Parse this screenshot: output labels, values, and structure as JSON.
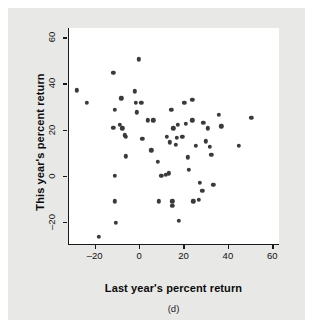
{
  "figure": {
    "caption": "(d)",
    "background_color": "#e8e8e6",
    "plot_background_color": "#ffffff",
    "point_color": "#3a3a3a",
    "axis_color": "#1a1a1a"
  },
  "chart_data": {
    "type": "scatter",
    "title": "",
    "xlabel": "Last year's percent return",
    "ylabel": "This year's percent return",
    "xlim": [
      -32,
      63
    ],
    "ylim": [
      -30,
      64
    ],
    "xticks": [
      -20,
      0,
      20,
      40,
      60
    ],
    "xtick_labels": [
      "–20",
      "0",
      "20",
      "40",
      "60"
    ],
    "yticks": [
      -20,
      0,
      20,
      40,
      60
    ],
    "ytick_labels": [
      "–20",
      "0",
      "20",
      "40",
      "60"
    ],
    "grid": false,
    "legend": null,
    "n_points": 61,
    "points": [
      [
        -28.5,
        37.0
      ],
      [
        -24.0,
        31.5
      ],
      [
        -18.5,
        -26.5
      ],
      [
        -12.0,
        44.5
      ],
      [
        -11.5,
        28.5
      ],
      [
        -12.0,
        20.8
      ],
      [
        -11.5,
        0.0
      ],
      [
        -11.5,
        -11.0
      ],
      [
        -11.0,
        -20.5
      ],
      [
        -8.5,
        33.5
      ],
      [
        -8.0,
        20.5
      ],
      [
        -7.0,
        17.5
      ],
      [
        -6.5,
        17.0
      ],
      [
        -6.5,
        8.5
      ],
      [
        -2.5,
        36.5
      ],
      [
        -2.0,
        31.5
      ],
      [
        -1.5,
        27.5
      ],
      [
        -0.5,
        50.5
      ],
      [
        1.0,
        16.0
      ],
      [
        3.5,
        24.0
      ],
      [
        5.0,
        11.0
      ],
      [
        8.0,
        6.0
      ],
      [
        8.5,
        -11.0
      ],
      [
        9.5,
        0.0
      ],
      [
        11.5,
        0.3
      ],
      [
        13.0,
        1.0
      ],
      [
        12.0,
        17.0
      ],
      [
        13.5,
        14.5
      ],
      [
        14.0,
        28.5
      ],
      [
        14.5,
        -11.0
      ],
      [
        14.5,
        -13.0
      ],
      [
        16.0,
        13.5
      ],
      [
        16.5,
        16.5
      ],
      [
        17.0,
        22.0
      ],
      [
        17.5,
        -19.5
      ],
      [
        20.0,
        31.5
      ],
      [
        20.5,
        22.5
      ],
      [
        21.5,
        8.0
      ],
      [
        22.0,
        2.5
      ],
      [
        23.5,
        33.0
      ],
      [
        23.5,
        24.0
      ],
      [
        24.0,
        -11.0
      ],
      [
        26.5,
        -10.5
      ],
      [
        27.0,
        -3.0
      ],
      [
        28.0,
        -6.5
      ],
      [
        28.5,
        23.0
      ],
      [
        29.5,
        15.0
      ],
      [
        30.5,
        20.5
      ],
      [
        31.5,
        12.5
      ],
      [
        32.0,
        9.0
      ],
      [
        33.0,
        -4.0
      ],
      [
        35.5,
        26.5
      ],
      [
        36.5,
        21.5
      ],
      [
        44.5,
        13.0
      ],
      [
        50.0,
        25.0
      ],
      [
        -9.0,
        22.0
      ],
      [
        0.5,
        31.5
      ],
      [
        6.0,
        24.0
      ],
      [
        19.0,
        17.0
      ],
      [
        25.0,
        13.0
      ],
      [
        15.0,
        20.5
      ]
    ]
  }
}
